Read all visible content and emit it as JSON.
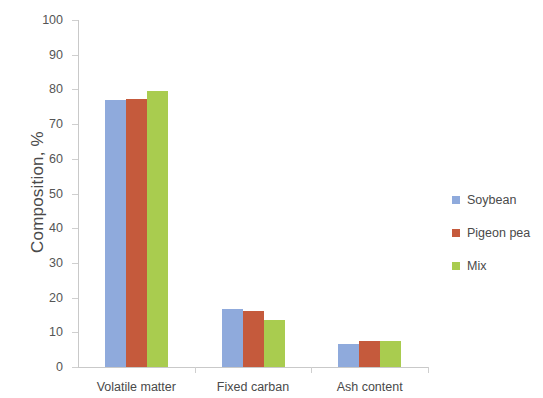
{
  "chart_data": {
    "type": "bar",
    "title": "",
    "subtitle": "",
    "xlabel": "",
    "ylabel": "Composition, %",
    "ylim": [
      0,
      100
    ],
    "ytick_step": 10,
    "yticks": [
      100,
      90,
      80,
      70,
      60,
      50,
      40,
      30,
      20,
      10,
      0
    ],
    "grid": false,
    "legend_position": "right",
    "categories": [
      "Volatile matter",
      "Fixed carban",
      "Ash content"
    ],
    "series": [
      {
        "name": "Soybean",
        "color": "#8FAADC",
        "values": [
          77.0,
          16.7,
          6.6
        ]
      },
      {
        "name": "Pigeon pea",
        "color": "#C55A3C",
        "values": [
          77.3,
          16.1,
          7.5
        ]
      },
      {
        "name": "Mix",
        "color": "#A9CC4F",
        "values": [
          79.5,
          13.5,
          7.6
        ]
      }
    ]
  }
}
